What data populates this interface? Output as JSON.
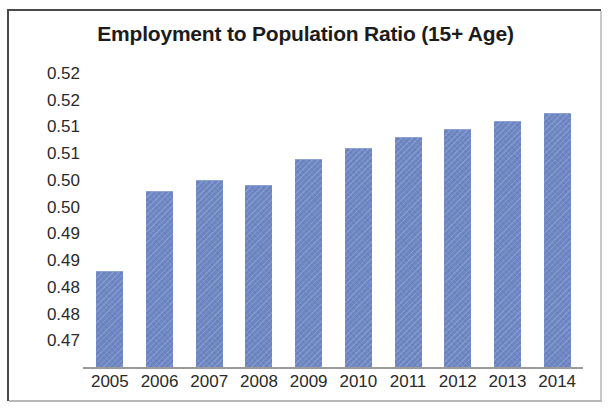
{
  "chart_data": {
    "type": "bar",
    "title": "Employment to Population Ratio (15+ Age)",
    "xlabel": "",
    "ylabel": "",
    "categories": [
      "2005",
      "2006",
      "2007",
      "2008",
      "2009",
      "2010",
      "2011",
      "2012",
      "2013",
      "2014"
    ],
    "values": [
      0.488,
      0.503,
      0.505,
      0.504,
      0.509,
      0.511,
      0.513,
      0.5145,
      0.516,
      0.5175
    ],
    "series": [
      {
        "name": "Employment to Population Ratio (15+ Age)",
        "values": [
          0.488,
          0.503,
          0.505,
          0.504,
          0.509,
          0.511,
          0.513,
          0.5145,
          0.516,
          0.5175
        ]
      }
    ],
    "ylim": [
      0.47,
      0.525
    ],
    "ytick_values": [
      0.525,
      0.52,
      0.515,
      0.51,
      0.505,
      0.5,
      0.495,
      0.49,
      0.485,
      0.48,
      0.475
    ],
    "ytick_labels": [
      "0.52",
      "0.52",
      "0.51",
      "0.51",
      "0.50",
      "0.50",
      "0.49",
      "0.49",
      "0.48",
      "0.48",
      "0.47"
    ],
    "grid": false,
    "legend": null,
    "legend_position": "none",
    "bar_color": "#6f88c4",
    "axis_color": "#9a9a9a",
    "text_color": "#2a2a2a",
    "border_color": "#4a4a4a"
  },
  "figure": {
    "title": "Employment to Population Ratio (15+ Age)"
  }
}
